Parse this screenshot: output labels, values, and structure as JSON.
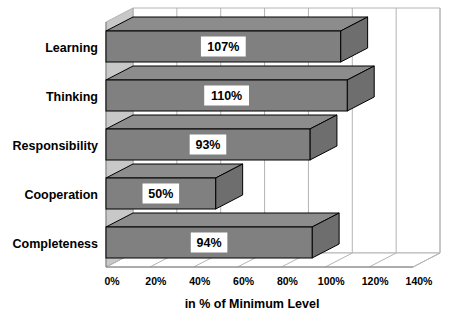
{
  "chart_data": {
    "type": "bar",
    "orientation": "horizontal",
    "style": "3d",
    "title": "",
    "subtitle": "",
    "xlabel": "in % of Minimum Level",
    "ylabel": "",
    "categories": [
      "Completeness",
      "Cooperation",
      "Responsibility",
      "Thinking",
      "Learning"
    ],
    "values": [
      94,
      50,
      93,
      110,
      107
    ],
    "data_labels": [
      "94%",
      "50%",
      "93%",
      "110%",
      "107%"
    ],
    "xlim": [
      0,
      140
    ],
    "xticks": [
      0,
      20,
      40,
      60,
      80,
      100,
      120,
      140
    ],
    "xtick_labels": [
      "0%",
      "20%",
      "40%",
      "60%",
      "80%",
      "100%",
      "120%",
      "140%"
    ],
    "grid": true,
    "legend": false,
    "legend_position": "none",
    "series": [
      {
        "name": "in % of Minimum Level",
        "values": [
          94,
          50,
          93,
          110,
          107
        ]
      }
    ],
    "bars": [
      {
        "category": "Learning",
        "value": 107,
        "label": "107%"
      },
      {
        "category": "Thinking",
        "value": 110,
        "label": "110%"
      },
      {
        "category": "Responsibility",
        "value": 93,
        "label": "93%"
      },
      {
        "category": "Cooperation",
        "value": 50,
        "label": "50%"
      },
      {
        "category": "Completeness",
        "value": 94,
        "label": "94%"
      }
    ],
    "colors": {
      "bar_front": "#808080",
      "bar_top": "#8c8c8c",
      "bar_side": "#6e6e6e",
      "bar_outline": "#000000",
      "grid_line": "#b4b4b4",
      "axis_line": "#808080",
      "wall_back": "#ffffff",
      "wall_floor": "#ffffff",
      "wall_left": "#c8c8c8",
      "label_box_fill": "#ffffff",
      "text": "#000000",
      "background": "#ffffff"
    }
  }
}
